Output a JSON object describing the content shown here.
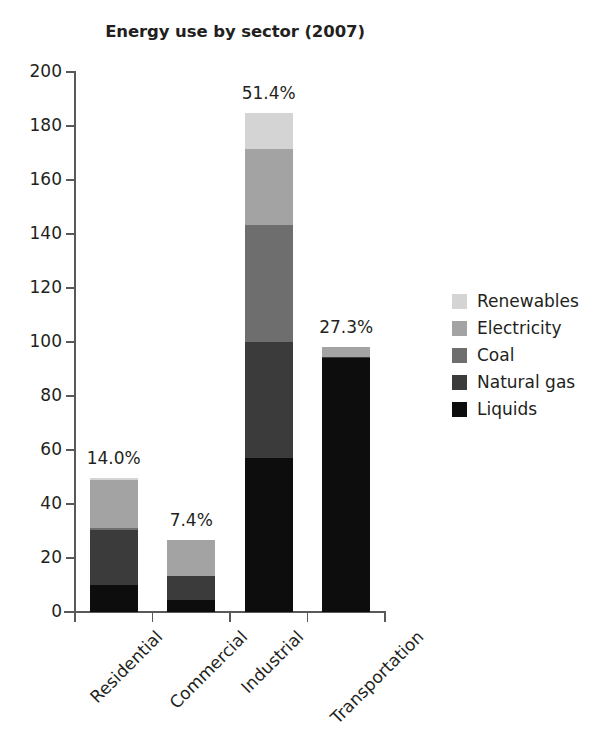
{
  "chart_data": {
    "type": "bar",
    "subtype": "stacked-bar",
    "title": "Energy use by sector (2007)",
    "xlabel": "",
    "ylabel": "",
    "ylim": [
      0,
      200
    ],
    "ytick_step": 20,
    "yticks": [
      0,
      20,
      40,
      60,
      80,
      100,
      120,
      140,
      160,
      180,
      200
    ],
    "ytick_labels": [
      "0",
      "20",
      "40",
      "60",
      "80",
      "100",
      "120",
      "140",
      "160",
      "180",
      "200"
    ],
    "grid": false,
    "legend_position": "right",
    "categories": [
      "Residential",
      "Commercial",
      "Industrial",
      "Transportation"
    ],
    "series": [
      {
        "name": "Liquids",
        "color": "#0d0d0d",
        "values": [
          10.0,
          4.5,
          57.0,
          94.0
        ]
      },
      {
        "name": "Natural gas",
        "color": "#3b3b3b",
        "values": [
          20.5,
          9.0,
          43.0,
          0.5
        ]
      },
      {
        "name": "Coal",
        "color": "#6e6e6e",
        "values": [
          0.5,
          0.0,
          43.5,
          0.0
        ]
      },
      {
        "name": "Electricity",
        "color": "#a3a3a3",
        "values": [
          18.0,
          13.0,
          28.0,
          3.5
        ]
      },
      {
        "name": "Renewables",
        "color": "#d4d4d4",
        "values": [
          0.5,
          0.0,
          13.5,
          0.0
        ]
      }
    ],
    "stack_order_bottom_to_top": [
      "Liquids",
      "Natural gas",
      "Coal",
      "Electricity",
      "Renewables"
    ],
    "totals": [
      49.5,
      26.5,
      185.0,
      98.0
    ],
    "bar_labels": [
      "14.0%",
      "7.4%",
      "51.4%",
      "27.3%"
    ],
    "legend_entries": [
      {
        "label": "Renewables",
        "color": "#d4d4d4"
      },
      {
        "label": "Electricity",
        "color": "#a3a3a3"
      },
      {
        "label": "Coal",
        "color": "#6e6e6e"
      },
      {
        "label": "Natural gas",
        "color": "#3b3b3b"
      },
      {
        "label": "Liquids",
        "color": "#0d0d0d"
      }
    ]
  },
  "axis_color": "#58595b",
  "text_color": "#231f20"
}
